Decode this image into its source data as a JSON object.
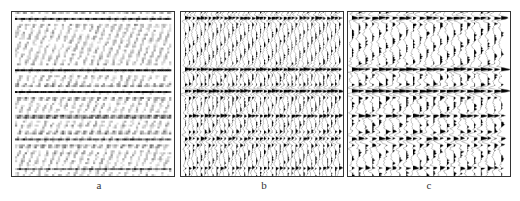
{
  "figure": {
    "panels": [
      {
        "id": "a",
        "label": "a",
        "left": 11,
        "style": "variable-density",
        "traces": 80
      },
      {
        "id": "b",
        "label": "b",
        "left": 180,
        "style": "wiggle",
        "traces": 40
      },
      {
        "id": "c",
        "label": "c",
        "left": 347,
        "style": "wiggle",
        "traces": 23
      }
    ],
    "events": [
      {
        "name": "top-wavelets",
        "y": 6,
        "thickness": 10,
        "strength": 0.8
      },
      {
        "name": "reflector-1",
        "y": 58,
        "thickness": 8,
        "strength": 1.0
      },
      {
        "name": "reflector-2",
        "y": 80,
        "thickness": 12,
        "strength": 1.0
      },
      {
        "name": "reflector-3",
        "y": 105,
        "thickness": 6,
        "strength": 0.75
      },
      {
        "name": "lower-events",
        "y": 128,
        "thickness": 20,
        "strength": 0.55
      },
      {
        "name": "bottom-events",
        "y": 158,
        "thickness": 6,
        "strength": 0.5
      }
    ],
    "colors": {
      "ink": "#000000",
      "border": "#333333",
      "background": "#ffffff"
    }
  }
}
